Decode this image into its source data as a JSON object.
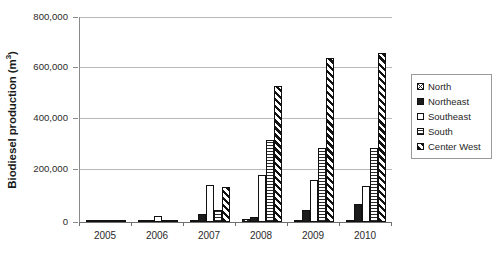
{
  "chart_data": {
    "type": "bar",
    "title": "",
    "subtitle": "",
    "xlabel": "",
    "ylabel": "Biodiesel production (m3)",
    "ylabel_display": "Biodiesel production (m",
    "ylabel_superscript": "3",
    "ylabel_suffix": ")",
    "categories": [
      "2005",
      "2006",
      "2007",
      "2008",
      "2009",
      "2010"
    ],
    "ylim": [
      0,
      800000
    ],
    "yticks": [
      0,
      200000,
      400000,
      600000,
      800000
    ],
    "ytick_labels": [
      "0",
      "200,000",
      "400,000",
      "600,000",
      "800,000"
    ],
    "grid": true,
    "grid_axis": "y",
    "legend_position": "right",
    "bar_style": "grouped",
    "series": [
      {
        "name": "North",
        "pattern": "crosshatch",
        "values": [
          0,
          0,
          0,
          12000,
          0,
          0
        ]
      },
      {
        "name": "Northeast",
        "pattern": "solid-black",
        "values": [
          0,
          2000,
          30000,
          20000,
          48000,
          72000
        ]
      },
      {
        "name": "Southeast",
        "pattern": "white-blank",
        "values": [
          0,
          22000,
          145000,
          185000,
          165000,
          140000
        ]
      },
      {
        "name": "South",
        "pattern": "horizontal-hatch",
        "values": [
          0,
          8000,
          45000,
          320000,
          290000,
          290000
        ]
      },
      {
        "name": "Center West",
        "pattern": "diagonal-stripes",
        "values": [
          0,
          8000,
          135000,
          530000,
          640000,
          660000
        ]
      }
    ],
    "extra_bars": {
      "note": "2010 South-group tall hatched bar",
      "2010_southeast_tall": 400000
    },
    "colors": {
      "ink": "#111111",
      "gridline": "#b9b9b9",
      "axis": "#6f6f6f",
      "background": "#ffffff"
    }
  },
  "legend": {
    "items": [
      {
        "label": "North"
      },
      {
        "label": "Northeast"
      },
      {
        "label": "Southeast"
      },
      {
        "label": "South"
      },
      {
        "label": "Center West"
      }
    ]
  }
}
